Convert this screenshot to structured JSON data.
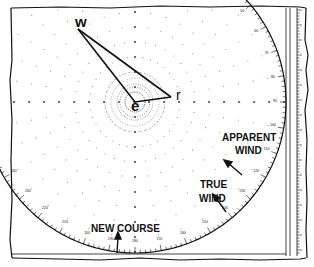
{
  "diagram": {
    "type": "maneuvering-board wind triangle",
    "points": {
      "w": {
        "label": "w",
        "x": 78,
        "y": 29
      },
      "e": {
        "label": "e",
        "x": 135,
        "y": 102
      },
      "r": {
        "label": "r",
        "x": 171,
        "y": 97
      }
    },
    "labels": {
      "apparent_wind_line1": "APPARENT",
      "apparent_wind_line2": "WIND",
      "true_wind_line1": "TRUE",
      "true_wind_line2": "WIND",
      "new_course": "NEW COURSE"
    },
    "compass": {
      "center": [
        135,
        102
      ],
      "radius": 151,
      "bearing_labels": [
        "10",
        "20",
        "30",
        "40",
        "50",
        "60",
        "70",
        "80",
        "90",
        "100",
        "110",
        "120",
        "130",
        "140",
        "150",
        "160",
        "170",
        "180",
        "190",
        "200",
        "210",
        "220",
        "230",
        "240",
        "250"
      ]
    },
    "colors": {
      "ink": "#111111",
      "grid_dots": "#9a9a9a",
      "paper": "#ffffff"
    }
  }
}
